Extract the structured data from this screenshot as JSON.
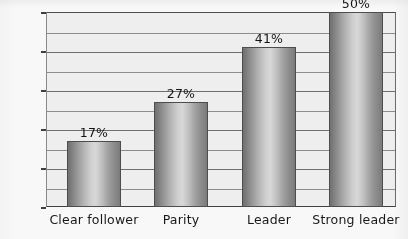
{
  "chart_data": {
    "type": "bar",
    "title": "",
    "subtitle": "",
    "xlabel": "",
    "ylabel": "",
    "categories": [
      "Clear follower",
      "Parity",
      "Leader",
      "Strong leader"
    ],
    "values": [
      17,
      27,
      41,
      50
    ],
    "data_labels": [
      "17%",
      "27%",
      "41%",
      "50%"
    ],
    "ylim": [
      0,
      50
    ],
    "y_major_ticks": [
      0,
      10,
      20,
      30,
      40,
      50
    ],
    "y_tick_labels": [
      "0",
      "10",
      "20",
      "30",
      "40",
      "50%"
    ],
    "y_minor_step": 5,
    "grid": "horizontal",
    "legend": "none",
    "series": [
      {
        "name": "Share of respondents",
        "values": [
          17,
          27,
          41,
          50
        ]
      }
    ]
  },
  "colors": {
    "bar_light": "#dcdcdc",
    "bar_dark": "#6f6f6f",
    "bar_outline": "#4b4b4b",
    "plot_background": "#f3f3f3",
    "gridline": "#8c8c8c",
    "axis": "#3d3d3d",
    "text": "#141414",
    "page_background": "#fdfdfd"
  }
}
